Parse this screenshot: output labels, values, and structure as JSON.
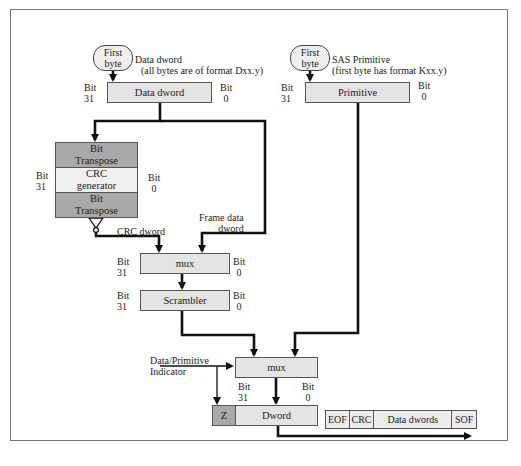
{
  "diagram": {
    "left_source": {
      "first_byte": [
        "First",
        "byte"
      ],
      "caption": [
        "Data dword",
        "(all bytes are of format Dxx.y)"
      ],
      "box": "Data dword",
      "bit_left": [
        "Bit",
        "31"
      ],
      "bit_right": [
        "Bit",
        "0"
      ]
    },
    "right_source": {
      "first_byte": [
        "First",
        "byte"
      ],
      "caption": [
        "SAS Primitive",
        "(first byte has format Kxx.y)"
      ],
      "box": "Primitive",
      "bit_left": [
        "Bit",
        "31"
      ],
      "bit_right": [
        "Bit",
        "0"
      ]
    },
    "crc_block": {
      "top": [
        "Bit",
        "Transpose"
      ],
      "middle": [
        "CRC",
        "generator"
      ],
      "bottom": [
        "Bit",
        "Transpose"
      ],
      "bit_left": [
        "Bit",
        "31"
      ],
      "bit_right": [
        "Bit",
        "0"
      ]
    },
    "labels": {
      "crc_dword": "CRC dword",
      "frame_data_dword": [
        "Frame data",
        "dword"
      ],
      "data_primitive_indicator": [
        "Data/Primitive",
        "Indicator"
      ]
    },
    "mux1": {
      "label": "mux",
      "bit_left": [
        "Bit",
        "31"
      ],
      "bit_right": [
        "Bit",
        "0"
      ]
    },
    "scrambler": {
      "label": "Scrambler",
      "bit_left": [
        "Bit",
        "31"
      ],
      "bit_right": [
        "Bit",
        "0"
      ]
    },
    "mux2": {
      "label": "mux"
    },
    "output": {
      "z": "Z",
      "dword": "Dword",
      "bit_left": [
        "Bit",
        "31"
      ],
      "bit_right": [
        "Bit",
        "0"
      ]
    },
    "frame_strip": [
      "EOF",
      "CRC",
      "Data dwords",
      "SOF"
    ],
    "colors": {
      "dark_fill": "#a9a9a9",
      "light_fill": "#e4e4e4",
      "wire": "#111111",
      "frame": "#777777"
    }
  }
}
